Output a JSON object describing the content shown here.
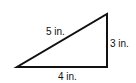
{
  "diagram": {
    "type": "right-triangle",
    "hypotenuse_label": "5 in.",
    "vertical_leg_label": "3 in.",
    "base_label": "4 in."
  }
}
